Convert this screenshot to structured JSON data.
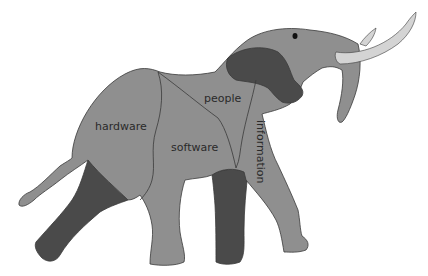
{
  "diagram": {
    "labels": {
      "hardware": "hardware",
      "software": "software",
      "people": "people",
      "information": "information"
    },
    "colors": {
      "body": "#8f8f8f",
      "dark": "#4a4a4a",
      "tusk": "#d4d4d4",
      "outline": "#3a3a3a",
      "background": "#ffffff"
    }
  }
}
